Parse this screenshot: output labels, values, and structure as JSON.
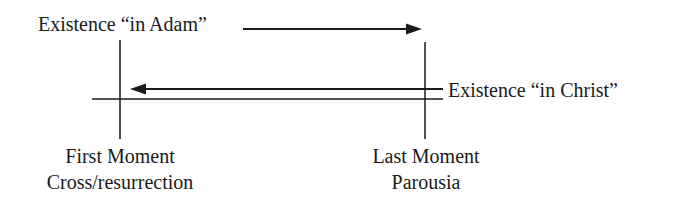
{
  "diagram": {
    "title": "",
    "labels": {
      "adam": "Existence “in Adam”",
      "christ": "Existence “in Christ”",
      "first_moment": {
        "line1": "First Moment",
        "line2": "Cross/resurrection"
      },
      "last_moment": {
        "line1": "Last Moment",
        "line2": "Parousia"
      }
    },
    "arrows": [
      {
        "name": "adam-arrow",
        "direction": "right",
        "from": "Existence in Adam",
        "to": "Last Moment"
      },
      {
        "name": "christ-arrow",
        "direction": "left",
        "from": "Existence in Christ",
        "to": "First Moment"
      }
    ],
    "markers": [
      {
        "name": "first-moment-marker",
        "label": "First Moment"
      },
      {
        "name": "last-moment-marker",
        "label": "Last Moment"
      }
    ],
    "colors": {
      "stroke": "#1a1a1a",
      "background": "#ffffff"
    }
  }
}
